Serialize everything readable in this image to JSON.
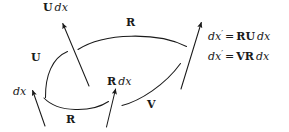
{
  "figure": {
    "type": "commutative-diagram",
    "background_color": "#ffffff",
    "stroke_color": "#1a1a1a"
  },
  "nodes": {
    "source": {
      "label": "dx",
      "x": 13,
      "y": 87
    },
    "intermediate_upper": {
      "label": "U dx",
      "bold_part": "U",
      "italic_part": "dx",
      "x": 43,
      "y": 2
    },
    "intermediate_lower": {
      "label": "R dx",
      "bold_part": "R",
      "italic_part": "dx",
      "x": 108,
      "y": 77
    }
  },
  "edge_labels": [
    {
      "name": "edge-label-u",
      "text": "U",
      "x": 31,
      "y": 52
    },
    {
      "name": "edge-label-r-top",
      "text": "R",
      "x": 126,
      "y": 17
    },
    {
      "name": "edge-label-r-bottom",
      "text": "R",
      "x": 66,
      "y": 115
    },
    {
      "name": "edge-label-v",
      "text": "V",
      "x": 147,
      "y": 100
    }
  ],
  "equations": [
    {
      "name": "equation-ru",
      "lhs_base": "dx",
      "lhs_prime": "′",
      "operator": "=",
      "rhs_bold": "RU",
      "rhs_italic": "dx",
      "full_text": "dx′ = RU dx",
      "x": 208,
      "y": 30
    },
    {
      "name": "equation-vr",
      "lhs_base": "dx",
      "lhs_prime": "′",
      "operator": "=",
      "rhs_bold": "VR",
      "rhs_italic": "dx",
      "full_text": "dx′ = VR dx",
      "x": 208,
      "y": 50
    }
  ],
  "arrows": [
    {
      "name": "arrow-dx",
      "from": [
        45,
        126
      ],
      "to": [
        32,
        89
      ]
    },
    {
      "name": "arrow-u-dx",
      "from": [
        89,
        86
      ],
      "to": [
        62,
        21
      ]
    },
    {
      "name": "arrow-r-dx",
      "from": [
        107,
        127
      ],
      "to": [
        116,
        87
      ]
    },
    {
      "name": "arrow-dx-prime",
      "from": [
        181,
        89
      ],
      "to": [
        202,
        20
      ]
    }
  ],
  "curves": [
    {
      "name": "curve-u",
      "from": [
        45,
        97
      ],
      "to": [
        67,
        51
      ]
    },
    {
      "name": "curve-r-top",
      "from": [
        78,
        49
      ],
      "to": [
        186,
        46
      ]
    },
    {
      "name": "curve-r-bottom",
      "from": [
        44,
        98
      ],
      "to": [
        108,
        101
      ]
    },
    {
      "name": "curve-v",
      "from": [
        122,
        105
      ],
      "to": [
        180,
        63
      ]
    }
  ]
}
